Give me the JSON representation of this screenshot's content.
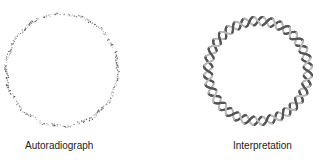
{
  "panels": [
    {
      "label": "Autoradiograph",
      "type": "dotted-circle"
    },
    {
      "label": "Interpretation",
      "type": "double-helix-circle"
    }
  ],
  "colors": {
    "dots": "#444444",
    "strand_dark": "#555555",
    "strand_light": "#b8b8b8",
    "text": "#222222"
  }
}
